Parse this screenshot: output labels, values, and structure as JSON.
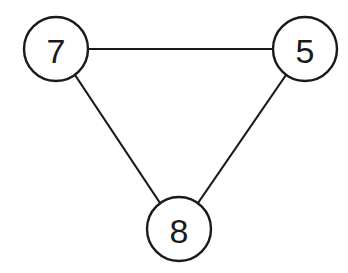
{
  "diagram": {
    "type": "undirected-graph",
    "nodes": [
      {
        "id": "n7",
        "label": "7",
        "cx": 56,
        "cy": 49,
        "r": 32
      },
      {
        "id": "n5",
        "label": "5",
        "cx": 305,
        "cy": 49,
        "r": 32
      },
      {
        "id": "n8",
        "label": "8",
        "cx": 179,
        "cy": 229,
        "r": 32
      }
    ],
    "edges": [
      {
        "from": "7",
        "to": "5"
      },
      {
        "from": "7",
        "to": "8"
      },
      {
        "from": "5",
        "to": "8"
      }
    ],
    "colors": {
      "stroke": "#1a1a1a",
      "fill": "#ffffff",
      "background": "#ffffff"
    }
  }
}
